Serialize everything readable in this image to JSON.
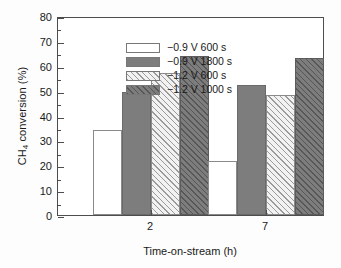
{
  "chart_data": {
    "type": "bar",
    "title": "",
    "xlabel": "Time-on-stream (h)",
    "ylabel_html": "CH<sub>4</sub> conversion (%)",
    "ylabel_plain": "CH4 conversion (%)",
    "categories": [
      "2",
      "7"
    ],
    "ylim": [
      0,
      80
    ],
    "ytick_labels": [
      "0",
      "10",
      "20",
      "30",
      "40",
      "50",
      "60",
      "70",
      "80"
    ],
    "ytick_values": [
      0,
      10,
      20,
      30,
      40,
      50,
      60,
      70,
      80
    ],
    "yminor_step": 5,
    "grid": false,
    "legend_position": "upper-left-inside",
    "series": [
      {
        "name": "−0.9 V 600 s",
        "style": "plain-white",
        "values": [
          34,
          21.7
        ]
      },
      {
        "name": "−0.9 V 1800 s",
        "style": "solid-gray",
        "values": [
          49.6,
          52.4
        ]
      },
      {
        "name": "−1.2 V 600 s",
        "style": "hatch-light",
        "values": [
          57,
          48.3
        ]
      },
      {
        "name": "−1.2 V 1000 s",
        "style": "hatch-dark",
        "values": [
          63.8,
          63.3
        ]
      }
    ]
  },
  "colors": {
    "axis": "#4d4d4d",
    "plain_white": "#ffffff",
    "solid_gray": "#7d7d7d",
    "hatch_light_bg": "#f2f2f2",
    "hatch_dark_bg": "#7d7d7d",
    "background": "#fdfdfd"
  }
}
